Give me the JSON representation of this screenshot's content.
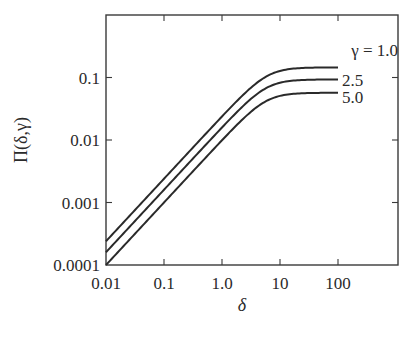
{
  "chart_data": {
    "type": "line",
    "title": "",
    "xlabel": "δ",
    "ylabel": "Π(δ,γ)",
    "xscale": "log",
    "yscale": "log",
    "xlim": [
      0.01,
      1000
    ],
    "ylim": [
      0.0001,
      1
    ],
    "grid": false,
    "legend": "inline labels at right end of curves",
    "x_ticks": [
      0.01,
      0.1,
      1.0,
      10,
      100
    ],
    "x_tick_labels": [
      "0.01",
      "0.1",
      "1.0",
      "10",
      "100"
    ],
    "y_ticks": [
      0.0001,
      0.001,
      0.01,
      0.1
    ],
    "y_tick_labels": [
      "0.0001",
      "0.001",
      "0.01",
      "0.1"
    ],
    "series": [
      {
        "name": "γ = 1.0",
        "label": "γ = 1.0",
        "slope_coefficient": 0.024,
        "plateau": 0.145,
        "x": [
          0.01,
          0.1,
          1.0,
          3.0,
          10,
          30,
          100
        ],
        "values": [
          0.00024,
          0.0024,
          0.0235,
          0.064,
          0.13,
          0.143,
          0.145
        ]
      },
      {
        "name": "γ = 2.5",
        "label": "2.5",
        "slope_coefficient": 0.016,
        "plateau": 0.093,
        "x": [
          0.01,
          0.1,
          1.0,
          3.0,
          10,
          30,
          100
        ],
        "values": [
          0.00016,
          0.0016,
          0.0158,
          0.042,
          0.08,
          0.091,
          0.093
        ]
      },
      {
        "name": "γ = 5.0",
        "label": "5.0",
        "slope_coefficient": 0.01,
        "plateau": 0.057,
        "x": [
          0.01,
          0.1,
          1.0,
          3.0,
          10,
          30,
          100
        ],
        "values": [
          0.0001,
          0.001,
          0.0098,
          0.026,
          0.049,
          0.056,
          0.057
        ]
      }
    ]
  },
  "layout": {
    "plot_left": 106,
    "plot_right": 398,
    "plot_top": 15,
    "plot_bottom": 265,
    "x_decade_px": 58,
    "y_decade_px": 62.5
  }
}
